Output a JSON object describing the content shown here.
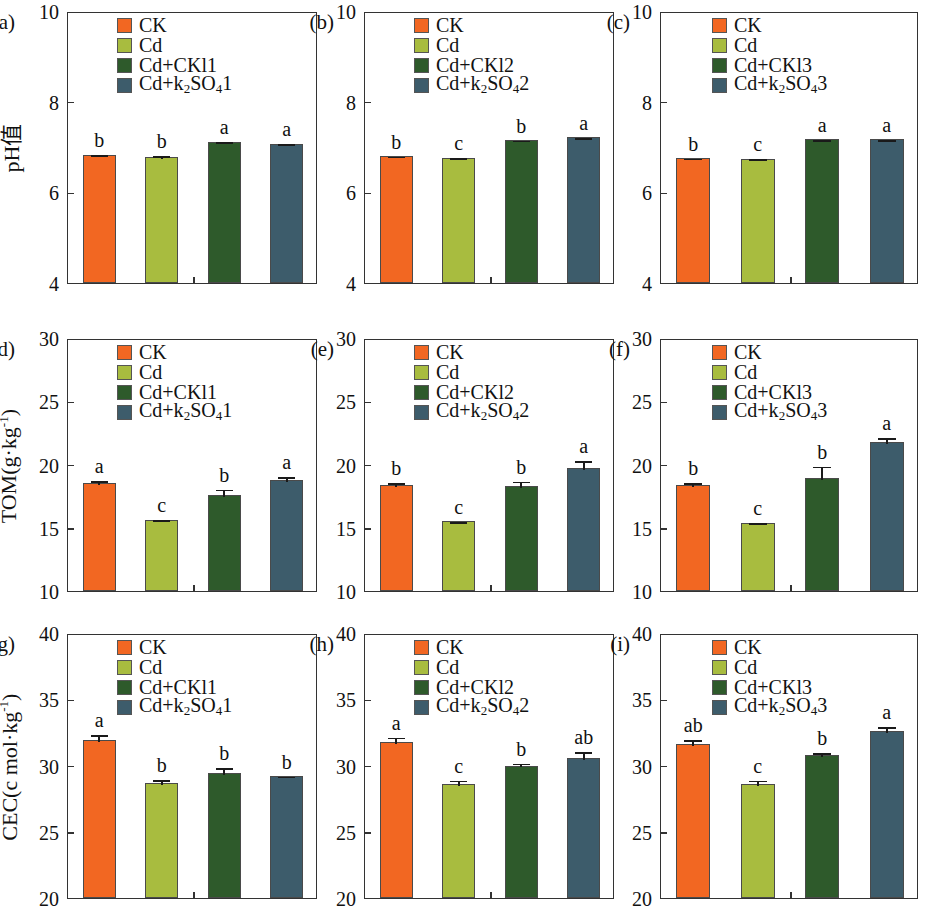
{
  "figure": {
    "panels": [
      "a",
      "b",
      "c",
      "d",
      "e",
      "f",
      "g",
      "h",
      "i"
    ]
  },
  "chart_data": [
    {
      "type": "bar",
      "panel": "(a)",
      "title": "",
      "ylabel": "pH值",
      "xlabel": "",
      "ylim": [
        4,
        10
      ],
      "yticks": [
        4,
        6,
        8,
        10
      ],
      "ytick_labels": [
        "4",
        "6",
        "8",
        "10"
      ],
      "grid": false,
      "legend_position": "top-center",
      "categories": [
        "CK",
        "Cd",
        "Cd+CKl1",
        "Cd+k2SO41"
      ],
      "legend": [
        "CK",
        "Cd",
        "Cd+CKl1",
        "Cd+k₂SO₄1"
      ],
      "values": [
        6.83,
        6.79,
        7.12,
        7.07
      ],
      "errors": [
        0.03,
        0.05,
        0.03,
        0.03
      ],
      "annotations": [
        "b",
        "b",
        "a",
        "a"
      ],
      "colors": [
        "#F26722",
        "#A8BC3F",
        "#2E5A2B",
        "#3D5C6B"
      ]
    },
    {
      "type": "bar",
      "panel": "(b)",
      "title": "",
      "ylabel": "",
      "xlabel": "",
      "ylim": [
        4,
        10
      ],
      "yticks": [
        4,
        6,
        8,
        10
      ],
      "ytick_labels": [
        "4",
        "6",
        "8",
        "10"
      ],
      "grid": false,
      "legend_position": "top-center",
      "categories": [
        "CK",
        "Cd",
        "Cd+CKl2",
        "Cd+k2SO42"
      ],
      "legend": [
        "CK",
        "Cd",
        "Cd+CKl2",
        "Cd+k₂SO₄2"
      ],
      "values": [
        6.8,
        6.76,
        7.16,
        7.22
      ],
      "errors": [
        0.03,
        0.04,
        0.02,
        0.02
      ],
      "annotations": [
        "b",
        "c",
        "b",
        "a"
      ],
      "colors": [
        "#F26722",
        "#A8BC3F",
        "#2E5A2B",
        "#3D5C6B"
      ]
    },
    {
      "type": "bar",
      "panel": "(c)",
      "title": "",
      "ylabel": "",
      "xlabel": "",
      "ylim": [
        4,
        10
      ],
      "yticks": [
        4,
        6,
        8,
        10
      ],
      "ytick_labels": [
        "4",
        "6",
        "8",
        "10"
      ],
      "grid": false,
      "legend_position": "top-center",
      "categories": [
        "CK",
        "Cd",
        "Cd+CKl3",
        "Cd+k2SO43"
      ],
      "legend": [
        "CK",
        "Cd",
        "Cd+CKl3",
        "Cd+k₂SO₄3"
      ],
      "values": [
        6.76,
        6.73,
        7.18,
        7.17
      ],
      "errors": [
        0.03,
        0.04,
        0.02,
        0.02
      ],
      "annotations": [
        "b",
        "c",
        "a",
        "a"
      ],
      "colors": [
        "#F26722",
        "#A8BC3F",
        "#2E5A2B",
        "#3D5C6B"
      ]
    },
    {
      "type": "bar",
      "panel": "(d)",
      "title": "",
      "ylabel": "TOM(g·kg⁻¹)",
      "xlabel": "",
      "ylim": [
        10,
        30
      ],
      "yticks": [
        10,
        15,
        20,
        25,
        30
      ],
      "ytick_labels": [
        "10",
        "15",
        "20",
        "25",
        "30"
      ],
      "grid": false,
      "legend_position": "top-center",
      "categories": [
        "CK",
        "Cd",
        "Cd+CKl1",
        "Cd+k2SO41"
      ],
      "legend": [
        "CK",
        "Cd",
        "Cd+CKl1",
        "Cd+k₂SO₄1"
      ],
      "values": [
        18.5,
        15.6,
        17.6,
        18.8
      ],
      "errors": [
        0.35,
        0.15,
        0.55,
        0.35
      ],
      "annotations": [
        "a",
        "c",
        "b",
        "a"
      ],
      "colors": [
        "#F26722",
        "#A8BC3F",
        "#2E5A2B",
        "#3D5C6B"
      ]
    },
    {
      "type": "bar",
      "panel": "(e)",
      "title": "",
      "ylabel": "",
      "xlabel": "",
      "ylim": [
        10,
        30
      ],
      "yticks": [
        10,
        15,
        20,
        25,
        30
      ],
      "ytick_labels": [
        "10",
        "15",
        "20",
        "25",
        "30"
      ],
      "grid": false,
      "legend_position": "top-center",
      "categories": [
        "CK",
        "Cd",
        "Cd+CKl2",
        "Cd+k2SO42"
      ],
      "legend": [
        "CK",
        "Cd",
        "Cd+CKl2",
        "Cd+k₂SO₄2"
      ],
      "values": [
        18.4,
        15.5,
        18.3,
        19.7
      ],
      "errors": [
        0.3,
        0.12,
        0.5,
        0.7
      ],
      "annotations": [
        "b",
        "c",
        "b",
        "a"
      ],
      "colors": [
        "#F26722",
        "#A8BC3F",
        "#2E5A2B",
        "#3D5C6B"
      ]
    },
    {
      "type": "bar",
      "panel": "(f)",
      "title": "",
      "ylabel": "",
      "xlabel": "",
      "ylim": [
        10,
        30
      ],
      "yticks": [
        10,
        15,
        20,
        25,
        30
      ],
      "ytick_labels": [
        "10",
        "15",
        "20",
        "25",
        "30"
      ],
      "grid": false,
      "legend_position": "top-center",
      "categories": [
        "CK",
        "Cd",
        "Cd+CKl3",
        "Cd+k2SO43"
      ],
      "legend": [
        "CK",
        "Cd",
        "Cd+CKl3",
        "Cd+k₂SO₄3"
      ],
      "values": [
        18.4,
        15.4,
        18.9,
        21.8
      ],
      "errors": [
        0.3,
        0.12,
        1.1,
        0.45
      ],
      "annotations": [
        "b",
        "c",
        "b",
        "a"
      ],
      "colors": [
        "#F26722",
        "#A8BC3F",
        "#2E5A2B",
        "#3D5C6B"
      ]
    },
    {
      "type": "bar",
      "panel": "(g)",
      "title": "",
      "ylabel": "CEC(c mol·kg⁻¹)",
      "xlabel": "",
      "ylim": [
        20,
        40
      ],
      "yticks": [
        20,
        25,
        30,
        35,
        40
      ],
      "ytick_labels": [
        "20",
        "25",
        "30",
        "35",
        "40"
      ],
      "grid": false,
      "legend_position": "top-center",
      "categories": [
        "CK",
        "Cd",
        "Cd+CKl1",
        "Cd+k2SO41"
      ],
      "legend": [
        "CK",
        "Cd",
        "Cd+CKl1",
        "Cd+k₂SO₄1"
      ],
      "values": [
        31.9,
        28.7,
        29.4,
        29.2
      ],
      "errors": [
        0.55,
        0.35,
        0.55,
        0.12
      ],
      "annotations": [
        "a",
        "b",
        "b",
        "b"
      ],
      "colors": [
        "#F26722",
        "#A8BC3F",
        "#2E5A2B",
        "#3D5C6B"
      ]
    },
    {
      "type": "bar",
      "panel": "(h)",
      "title": "",
      "ylabel": "",
      "xlabel": "",
      "ylim": [
        20,
        40
      ],
      "yticks": [
        20,
        25,
        30,
        35,
        40
      ],
      "ytick_labels": [
        "20",
        "25",
        "30",
        "35",
        "40"
      ],
      "grid": false,
      "legend_position": "top-center",
      "categories": [
        "CK",
        "Cd",
        "Cd+CKl2",
        "Cd+k2SO42"
      ],
      "legend": [
        "CK",
        "Cd",
        "Cd+CKl2",
        "Cd+k₂SO₄2"
      ],
      "values": [
        31.8,
        28.6,
        30.0,
        30.6
      ],
      "errors": [
        0.45,
        0.4,
        0.3,
        0.55
      ],
      "annotations": [
        "a",
        "c",
        "b",
        "ab"
      ],
      "colors": [
        "#F26722",
        "#A8BC3F",
        "#2E5A2B",
        "#3D5C6B"
      ]
    },
    {
      "type": "bar",
      "panel": "(i)",
      "title": "",
      "ylabel": "",
      "xlabel": "",
      "ylim": [
        20,
        40
      ],
      "yticks": [
        20,
        25,
        30,
        35,
        40
      ],
      "ytick_labels": [
        "20",
        "25",
        "30",
        "35",
        "40"
      ],
      "grid": false,
      "legend_position": "top-center",
      "categories": [
        "CK",
        "Cd",
        "Cd+CKl3",
        "Cd+k2SO43"
      ],
      "legend": [
        "CK",
        "Cd",
        "Cd+CKl3",
        "Cd+k₂SO₄3"
      ],
      "values": [
        31.6,
        28.6,
        30.8,
        32.6
      ],
      "errors": [
        0.45,
        0.4,
        0.3,
        0.45
      ],
      "annotations": [
        "ab",
        "c",
        "b",
        "a"
      ],
      "colors": [
        "#F26722",
        "#A8BC3F",
        "#2E5A2B",
        "#3D5C6B"
      ]
    }
  ]
}
